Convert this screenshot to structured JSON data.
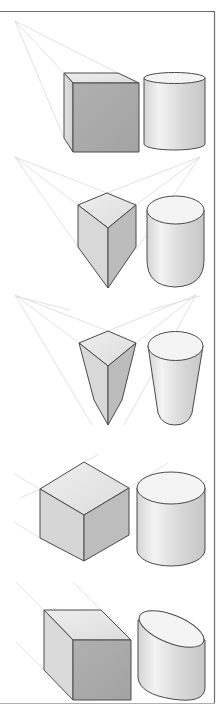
{
  "figure": {
    "colors": {
      "background": "#ffffff",
      "frame": "#6e6e6e",
      "outline": "#4a4a4a",
      "guide_lines": "#d9d9d9",
      "face_top": "#e6e6e6",
      "face_side_light": "#d6d6d6",
      "face_front_dark": "#a9a9a9",
      "cylinder_light": "#f2f2f2",
      "cylinder_mid": "#cfcfcf"
    },
    "rows": [
      {
        "name": "one-point-perspective",
        "shapes": [
          "cube",
          "cylinder"
        ]
      },
      {
        "name": "three-point-perspective-downward",
        "shapes": [
          "cube",
          "cylinder"
        ]
      },
      {
        "name": "three-point-perspective-steep",
        "shapes": [
          "cube",
          "cylinder"
        ]
      },
      {
        "name": "isometric-projection",
        "shapes": [
          "cube",
          "cylinder"
        ]
      },
      {
        "name": "oblique-projection",
        "shapes": [
          "cube",
          "cylinder"
        ]
      }
    ]
  }
}
